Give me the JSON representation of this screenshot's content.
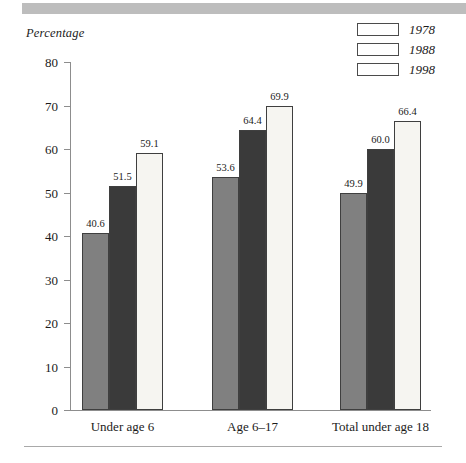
{
  "figure": {
    "y_axis_title": "Percentage",
    "banner": "decorative-gray-bar",
    "accent_color": "#bdbdbd"
  },
  "legend": {
    "items": [
      {
        "label": "1978",
        "color": "#808080",
        "series_key": "s1978"
      },
      {
        "label": "1988",
        "color": "#3a3a3a",
        "series_key": "s1988"
      },
      {
        "label": "1998",
        "color": "#f6f5f1",
        "series_key": "s1998"
      }
    ]
  },
  "axis": {
    "ticks": [
      "80",
      "70",
      "60",
      "50",
      "40",
      "30",
      "20",
      "10",
      "0"
    ]
  },
  "chart_data": {
    "type": "bar",
    "title": "",
    "subtitle": "",
    "xlabel": "",
    "ylabel": "Percentage",
    "ylim": [
      0,
      80
    ],
    "ytick_step": 10,
    "yticks": [
      0,
      10,
      20,
      30,
      40,
      50,
      60,
      70,
      80
    ],
    "grid": false,
    "legend_position": "top-right",
    "categories": [
      "Under age 6",
      "Age 6–17",
      "Total under age 18"
    ],
    "series": [
      {
        "name": "1978",
        "color": "#808080",
        "values": [
          40.6,
          53.6,
          49.9
        ]
      },
      {
        "name": "1988",
        "color": "#3a3a3a",
        "values": [
          51.5,
          64.4,
          60.0
        ]
      },
      {
        "name": "1998",
        "color": "#f6f5f1",
        "values": [
          59.1,
          69.9,
          66.4
        ]
      }
    ],
    "data_labels": [
      [
        "40.6",
        "51.5",
        "59.1"
      ],
      [
        "53.6",
        "64.4",
        "69.9"
      ],
      [
        "49.9",
        "60.0",
        "66.4"
      ]
    ]
  }
}
